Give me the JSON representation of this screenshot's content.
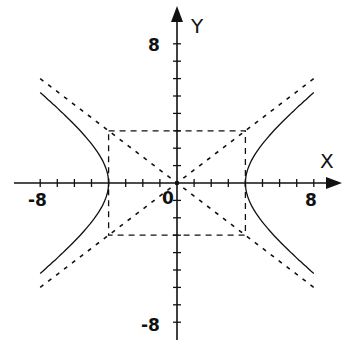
{
  "diagram": {
    "title": "",
    "type": "hyperbola-with-asymptotes",
    "equation": "x^2/16 - y^2/9 = 1",
    "a": 4,
    "b": 3,
    "axis": {
      "x_label": "X",
      "y_label": "Y",
      "x_range": [
        -8,
        8
      ],
      "y_range": [
        -8,
        8
      ],
      "origin_label": "0",
      "tick_step": 1,
      "tick_labels": {
        "x_min": "-8",
        "x_max": "8",
        "y_max": "8",
        "y_min": "-8"
      }
    },
    "asymptotes": [
      "y = 3x/4",
      "y = -3x/4"
    ],
    "central_rectangle": {
      "x": [
        -4,
        4
      ],
      "y": [
        -3,
        3
      ],
      "style": "dashed"
    },
    "vertices": [
      [
        -4,
        0
      ],
      [
        4,
        0
      ]
    ],
    "colors": {
      "ink": "#111111",
      "background": "#ffffff"
    }
  }
}
